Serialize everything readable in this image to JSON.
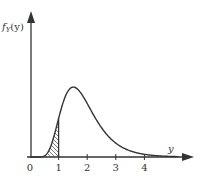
{
  "chart_data": {
    "type": "line",
    "title": "",
    "xlabel": "y",
    "ylabel": "f_Y(y)",
    "ylabel_display": "fY(y)",
    "x_ticks": [
      "0",
      "1",
      "2",
      "3",
      "4"
    ],
    "x_tick_values": [
      0,
      1,
      2,
      3,
      4
    ],
    "xlim": [
      0,
      5.7
    ],
    "ylim": [
      0,
      1
    ],
    "grid": false,
    "legend": "none",
    "series": [
      {
        "name": "f_Y(y)",
        "x": [
          0,
          0.25,
          0.5,
          0.75,
          1.0,
          1.25,
          1.5,
          1.75,
          2.0,
          2.5,
          3.0,
          3.5,
          4.0,
          4.5,
          5.0
        ],
        "values": [
          0,
          0.01,
          0.08,
          0.3,
          0.62,
          0.86,
          0.92,
          0.86,
          0.73,
          0.46,
          0.25,
          0.12,
          0.05,
          0.02,
          0.005
        ]
      }
    ],
    "shaded_region": {
      "x_from": 0,
      "x_to": 1,
      "style": "hatched",
      "description": "area under curve from 0 to 1"
    },
    "annotations": []
  },
  "labels": {
    "y_axis": "f",
    "y_axis_sub": "Y",
    "y_axis_arg": "(y)",
    "x_axis": "y",
    "ticks": [
      "0",
      "1",
      "2",
      "3",
      "4"
    ]
  }
}
